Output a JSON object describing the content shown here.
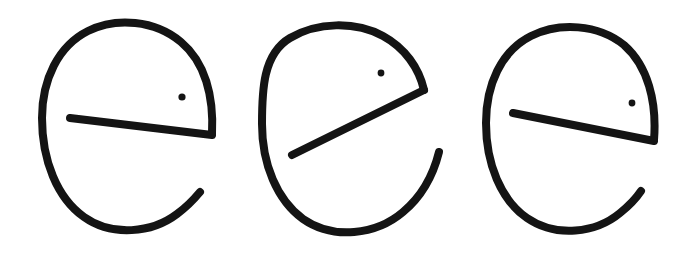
{
  "canvas": {
    "width": 692,
    "height": 253,
    "background_color": "#ffffff",
    "ink_color": "#141414",
    "description": "Three hand-drawn open-circle glyphs resembling the letter e, each with a crossbar and a small eye dot"
  },
  "glyphs": [
    {
      "id": "glyph-1",
      "label": "glyph-1",
      "ink_color": "#141414",
      "stroke_width": 8,
      "bounds": {
        "x": 42,
        "y": 22,
        "width": 176,
        "height": 210
      },
      "body": {
        "name": "open-loop-arc",
        "path": "M 212 134 C 214 96 205 62 181 42 C 155 20 116 17 88 31 C 58 46 42 80 42 118 C 42 160 57 198 84 217 C 112 237 152 233 177 214 C 188 206 195 198 200 192",
        "start_point": [
          212,
          134
        ],
        "end_point": [
          200,
          192
        ],
        "gap": "lower-right"
      },
      "crossbar": {
        "name": "crossbar",
        "path": "M 70 118 L 212 135",
        "start_point": [
          70,
          118
        ],
        "end_point": [
          212,
          135
        ],
        "free_end": "left",
        "attached_end": "right"
      },
      "eye": {
        "name": "eye-dot",
        "center": [
          182,
          97
        ],
        "radius": 3.6
      }
    },
    {
      "id": "glyph-2",
      "label": "glyph-2",
      "ink_color": "#141414",
      "stroke_width": 8,
      "bounds": {
        "x": 262,
        "y": 24,
        "width": 178,
        "height": 208
      },
      "body": {
        "name": "open-loop-arc",
        "path": "M 424 90 C 419 68 405 48 383 36 C 355 21 317 22 290 38 C 263 54 262 90 262 124 C 262 164 277 200 303 219 C 333 240 376 235 403 212 C 421 197 433 176 439 152",
        "start_point": [
          424,
          90
        ],
        "end_point": [
          439,
          152
        ],
        "gap": "lower-right"
      },
      "crossbar": {
        "name": "crossbar",
        "path": "M 292 155 L 424 90",
        "start_point": [
          292,
          155
        ],
        "end_point": [
          424,
          90
        ],
        "free_end": "lower-left",
        "attached_end": "upper-right"
      },
      "eye": {
        "name": "eye-dot",
        "center": [
          381,
          73
        ],
        "radius": 3.4
      }
    },
    {
      "id": "glyph-3",
      "label": "glyph-3",
      "ink_color": "#141414",
      "stroke_width": 8,
      "bounds": {
        "x": 486,
        "y": 26,
        "width": 174,
        "height": 206
      },
      "body": {
        "name": "open-loop-arc",
        "path": "M 654 140 C 657 102 648 66 624 45 C 598 24 559 22 531 36 C 501 51 486 85 486 123 C 486 164 501 200 527 218 C 556 238 596 233 620 213 C 630 205 637 197 641 191",
        "start_point": [
          654,
          140
        ],
        "end_point": [
          641,
          191
        ],
        "gap": "lower-right"
      },
      "crossbar": {
        "name": "crossbar",
        "path": "M 513 113 L 654 141",
        "start_point": [
          513,
          113
        ],
        "end_point": [
          654,
          141
        ],
        "free_end": "left",
        "attached_end": "right"
      },
      "eye": {
        "name": "eye-dot",
        "center": [
          632,
          103
        ],
        "radius": 3.4
      }
    }
  ]
}
